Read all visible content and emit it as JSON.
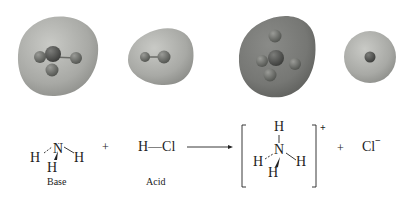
{
  "figure": {
    "models": [
      {
        "id": "ammonia-model",
        "species": "NH3",
        "surface_color": "#a9aaa6",
        "atom_color": "#6e706c"
      },
      {
        "id": "hcl-model",
        "species": "HCl",
        "surface_color": "#b4b5b1",
        "atom_color": "#6e706c"
      },
      {
        "id": "ammonium-model",
        "species": "NH4+",
        "surface_color": "#7a7b78",
        "atom_color": "#5a5c58"
      },
      {
        "id": "chloride-model",
        "species": "Cl-",
        "surface_color": "#b1b2ae",
        "atom_color": "#5e605c"
      }
    ],
    "equation": {
      "reactant1": {
        "central": "N",
        "lone_pair": "··",
        "h_left": "H",
        "h_right": "H",
        "h_bottom": "H",
        "label": "Base"
      },
      "plus1": "+",
      "reactant2": {
        "formula": "H—Cl",
        "label": "Acid"
      },
      "product1": {
        "central": "N",
        "h_top": "H",
        "h_left": "H",
        "h_right": "H",
        "h_bottom": "H",
        "charge": "+"
      },
      "plus2": "+",
      "product2": {
        "formula": "Cl",
        "charge": "−"
      }
    }
  }
}
